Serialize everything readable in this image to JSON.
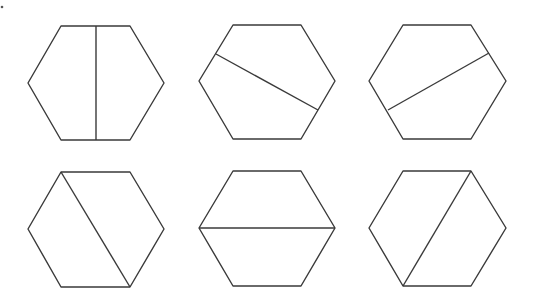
{
  "figure": {
    "stroke_color": "#3a3a3a",
    "background": "#ffffff",
    "hexagons": [
      {
        "id": 1,
        "row": 1,
        "col": 1,
        "cut": "vertical line through the midpoints of top and bottom edges",
        "points": [
          [
            28,
            83
          ],
          [
            61,
            26
          ],
          [
            130,
            26
          ],
          [
            164,
            83
          ],
          [
            130,
            140
          ],
          [
            61,
            140
          ]
        ],
        "line": [
          [
            96,
            26
          ],
          [
            96,
            140
          ]
        ]
      },
      {
        "id": 2,
        "row": 1,
        "col": 2,
        "cut": "slanted line from upper-left edge to lower-right edge",
        "points": [
          [
            199,
            81
          ],
          [
            233,
            25
          ],
          [
            301,
            25
          ],
          [
            335,
            81
          ],
          [
            301,
            139
          ],
          [
            233,
            139
          ]
        ],
        "line": [
          [
            216,
            54
          ],
          [
            318,
            110
          ]
        ]
      },
      {
        "id": 3,
        "row": 1,
        "col": 3,
        "cut": "slanted line from lower-left edge to upper-right edge",
        "points": [
          [
            369,
            81
          ],
          [
            403,
            25
          ],
          [
            471,
            25
          ],
          [
            506,
            81
          ],
          [
            471,
            139
          ],
          [
            403,
            139
          ]
        ],
        "line": [
          [
            388,
            110
          ],
          [
            489,
            53
          ]
        ]
      },
      {
        "id": 4,
        "row": 2,
        "col": 1,
        "cut": "diagonal from top-left vertex to bottom-right vertex",
        "points": [
          [
            28,
            229
          ],
          [
            61,
            172
          ],
          [
            130,
            172
          ],
          [
            164,
            229
          ],
          [
            130,
            287
          ],
          [
            61,
            287
          ]
        ],
        "line": [
          [
            61,
            172
          ],
          [
            130,
            287
          ]
        ]
      },
      {
        "id": 5,
        "row": 2,
        "col": 2,
        "cut": "horizontal long diagonal between left and right vertices",
        "points": [
          [
            199,
            228
          ],
          [
            233,
            171
          ],
          [
            301,
            171
          ],
          [
            335,
            228
          ],
          [
            301,
            286
          ],
          [
            233,
            286
          ]
        ],
        "line": [
          [
            199,
            228
          ],
          [
            335,
            228
          ]
        ]
      },
      {
        "id": 6,
        "row": 2,
        "col": 3,
        "cut": "diagonal from top-right vertex to bottom-left vertex",
        "points": [
          [
            369,
            228
          ],
          [
            403,
            171
          ],
          [
            471,
            171
          ],
          [
            506,
            228
          ],
          [
            471,
            286
          ],
          [
            403,
            286
          ]
        ],
        "line": [
          [
            471,
            171
          ],
          [
            403,
            286
          ]
        ]
      }
    ]
  }
}
